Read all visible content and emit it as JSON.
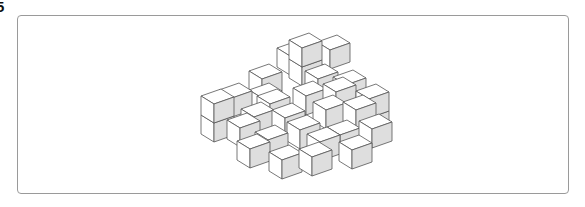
{
  "question_number": "5",
  "figure": {
    "colors": {
      "top": "#ffffff",
      "left": "#ffffff",
      "right": "#dedede",
      "stroke": "#555555",
      "frame": "#9a9a9a"
    },
    "projection": {
      "left": [
        -13,
        -8
      ],
      "right": [
        20,
        -7
      ],
      "height": 19
    },
    "cubes": [
      [
        290,
        56
      ],
      [
        330,
        50
      ],
      [
        262,
        79
      ],
      [
        302,
        67
      ],
      [
        302,
        48
      ],
      [
        262,
        98
      ],
      [
        318,
        79
      ],
      [
        346,
        85
      ],
      [
        232,
        98
      ],
      [
        270,
        104
      ],
      [
        306,
        96
      ],
      [
        336,
        92
      ],
      [
        214,
        123
      ],
      [
        214,
        104
      ],
      [
        369,
        118
      ],
      [
        369,
        99
      ],
      [
        254,
        117
      ],
      [
        285,
        118
      ],
      [
        326,
        110
      ],
      [
        356,
        110
      ],
      [
        240,
        128
      ],
      [
        300,
        130
      ],
      [
        340,
        135
      ],
      [
        372,
        129
      ],
      [
        268,
        140
      ],
      [
        320,
        142
      ],
      [
        250,
        149
      ],
      [
        282,
        160
      ],
      [
        312,
        157
      ],
      [
        352,
        150
      ]
    ]
  }
}
